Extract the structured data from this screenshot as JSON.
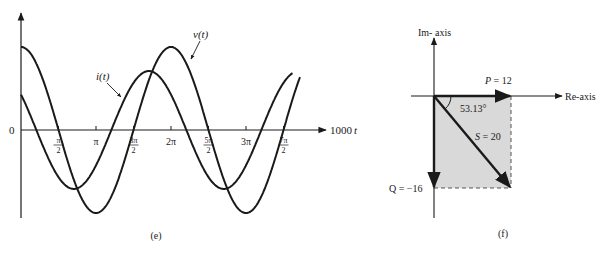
{
  "figure_e": {
    "caption": "(e)",
    "origin_label": "0",
    "x_axis_label": "1000",
    "x_axis_label_var": "t",
    "ticks": [
      {
        "num": "π",
        "den": "2",
        "pos": 0.5
      },
      {
        "num": "π",
        "den": "",
        "pos": 1.0
      },
      {
        "num": "3π",
        "den": "2",
        "pos": 1.5
      },
      {
        "num": "2π",
        "den": "",
        "pos": 2.0
      },
      {
        "num": "5π",
        "den": "2",
        "pos": 2.5
      },
      {
        "num": "3π",
        "den": "",
        "pos": 3.0
      },
      {
        "num": "7π",
        "den": "2",
        "pos": 3.5
      }
    ],
    "curve_v_label": "v(t)",
    "curve_i_label": "i(t)"
  },
  "figure_f": {
    "caption": "(f)",
    "im_axis_label": "Im- axis",
    "re_axis_label": "Re-axis",
    "p_label": "P = 12",
    "q_label": "Q = −16",
    "s_label": "S = 20",
    "angle_label": "53.13°",
    "fill_color": "#d9d9d9"
  },
  "chart_data": [
    {
      "type": "line",
      "title": "(e)",
      "xlabel": "1000t",
      "ylabel": "",
      "x_ticks": [
        "π/2",
        "π",
        "3π/2",
        "2π",
        "5π/2",
        "3π",
        "7π/2"
      ],
      "series": [
        {
          "name": "v(t)",
          "form": "Vm·cos(1000t)",
          "relative_amplitude": 1.0,
          "phase_deg": 0
        },
        {
          "name": "i(t)",
          "form": "Im·cos(1000t + 53.13°)",
          "relative_amplitude": 0.71,
          "phase_deg": 53.13
        }
      ],
      "x_range": [
        0,
        "≈3.65π"
      ],
      "grid": false
    },
    {
      "type": "phasor",
      "title": "(f)",
      "vectors": [
        {
          "name": "P",
          "value": 12,
          "direction": "Re+"
        },
        {
          "name": "Q",
          "value": -16,
          "direction": "Im−"
        },
        {
          "name": "S",
          "magnitude": 20,
          "angle_deg": -53.13
        }
      ],
      "angle_annotation": "53.13°",
      "axes": [
        "Re-axis",
        "Im- axis"
      ]
    }
  ]
}
